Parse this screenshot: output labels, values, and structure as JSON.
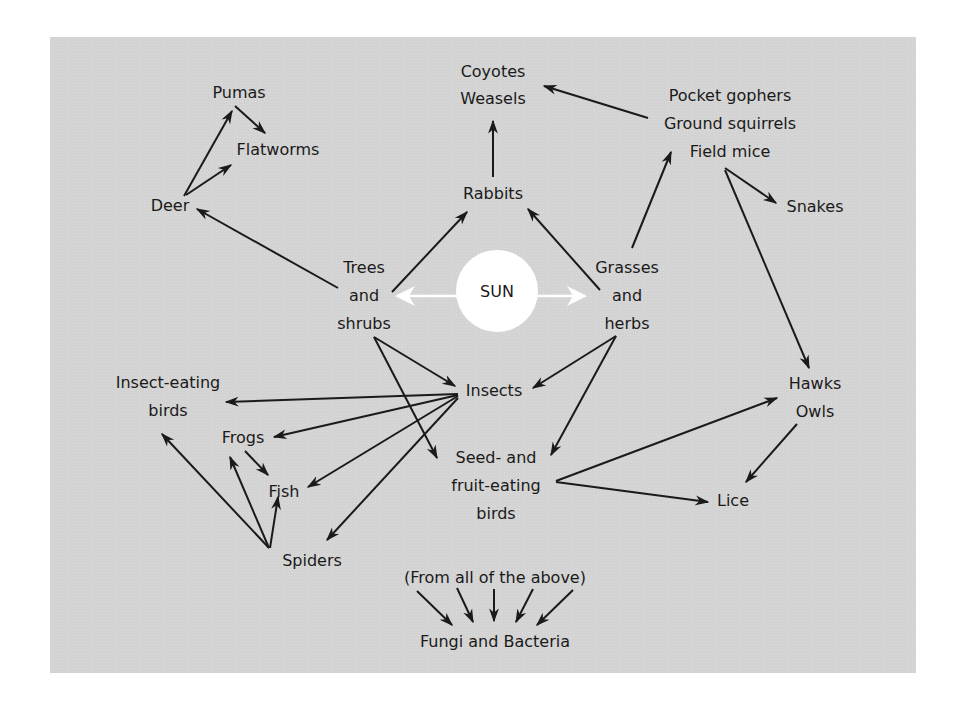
{
  "diagram": {
    "type": "food-web",
    "colors": {
      "background": "#d3d3d3",
      "text": "#1a1a1a",
      "arrows": "#1a1a1a",
      "sun": "#ffffff",
      "sun_arrows": "#ffffff"
    },
    "center": {
      "label": "SUN"
    },
    "nodes": {
      "pumas": "Pumas",
      "flatworms": "Flatworms",
      "deer": "Deer",
      "coyotes_weasels": "Coyotes\nWeasels",
      "rabbits": "Rabbits",
      "rodents": "Pocket gophers\nGround squirrels\nField mice",
      "snakes": "Snakes",
      "trees_shrubs": "Trees\nand\nshrubs",
      "grasses_herbs": "Grasses\nand\nherbs",
      "insect_eating_birds": "Insect-eating\nbirds",
      "insects": "Insects",
      "hawks_owls": "Hawks\nOwls",
      "frogs": "Frogs",
      "fish": "Fish",
      "seed_fruit_birds": "Seed- and\nfruit-eating\nbirds",
      "lice": "Lice",
      "spiders": "Spiders",
      "from_all": "(From all of the above)",
      "decomposers": "Fungi and Bacteria"
    },
    "edges": [
      [
        "SUN",
        "Trees and shrubs"
      ],
      [
        "SUN",
        "Grasses and herbs"
      ],
      [
        "Trees and shrubs",
        "Deer"
      ],
      [
        "Trees and shrubs",
        "Rabbits"
      ],
      [
        "Trees and shrubs",
        "Insects"
      ],
      [
        "Trees and shrubs",
        "Seed- and fruit-eating birds"
      ],
      [
        "Grasses and herbs",
        "Rabbits"
      ],
      [
        "Grasses and herbs",
        "Pocket gophers / Ground squirrels / Field mice"
      ],
      [
        "Grasses and herbs",
        "Insects"
      ],
      [
        "Grasses and herbs",
        "Seed- and fruit-eating birds"
      ],
      [
        "Deer",
        "Pumas"
      ],
      [
        "Deer",
        "Flatworms"
      ],
      [
        "Pumas",
        "Flatworms"
      ],
      [
        "Rabbits",
        "Coyotes / Weasels"
      ],
      [
        "Pocket gophers / Ground squirrels / Field mice",
        "Coyotes / Weasels"
      ],
      [
        "Pocket gophers / Ground squirrels / Field mice",
        "Snakes"
      ],
      [
        "Pocket gophers / Ground squirrels / Field mice",
        "Hawks / Owls"
      ],
      [
        "Insects",
        "Insect-eating birds"
      ],
      [
        "Insects",
        "Frogs"
      ],
      [
        "Insects",
        "Fish"
      ],
      [
        "Insects",
        "Spiders"
      ],
      [
        "Frogs",
        "Fish"
      ],
      [
        "Spiders",
        "Insect-eating birds"
      ],
      [
        "Spiders",
        "Frogs"
      ],
      [
        "Spiders",
        "Fish"
      ],
      [
        "Seed- and fruit-eating birds",
        "Hawks / Owls"
      ],
      [
        "Seed- and fruit-eating birds",
        "Lice"
      ],
      [
        "Hawks / Owls",
        "Lice"
      ],
      [
        "(From all of the above)",
        "Fungi and Bacteria"
      ]
    ]
  }
}
